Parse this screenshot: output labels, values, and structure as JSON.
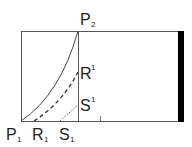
{
  "diagram": {
    "points": {
      "P1": {
        "label": "P",
        "sub": "1"
      },
      "P2": {
        "label": "P",
        "sub": "2"
      },
      "R1": {
        "label": "R",
        "sub": "1"
      },
      "S1": {
        "label": "S",
        "sub": "1"
      },
      "R_sup": {
        "label": "R",
        "sup": "1"
      },
      "S_sup": {
        "label": "S",
        "sup": "1"
      }
    },
    "curves": [
      {
        "name": "P1-P2",
        "style": "solid"
      },
      {
        "name": "R1-R1",
        "style": "dashed"
      },
      {
        "name": "S1-S1",
        "style": "dotted"
      }
    ],
    "colors": {
      "line": "#555555",
      "bar": "#000000"
    }
  }
}
